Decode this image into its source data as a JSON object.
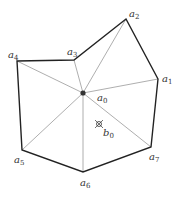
{
  "diagram": {
    "type": "star-shaped polygon triangulation",
    "center": {
      "id": "a0",
      "label": "a",
      "sub": "0",
      "x": 83,
      "y": 93,
      "lx": 97,
      "ly": 101
    },
    "interior_point": {
      "id": "b0",
      "label": "b",
      "sub": "0",
      "x": 99,
      "y": 124,
      "lx": 103,
      "ly": 136
    },
    "vertices": [
      {
        "id": "a1",
        "label": "a",
        "sub": "1",
        "x": 158,
        "y": 79,
        "lx": 162,
        "ly": 82
      },
      {
        "id": "a2",
        "label": "a",
        "sub": "2",
        "x": 126,
        "y": 19,
        "lx": 129,
        "ly": 17
      },
      {
        "id": "a3",
        "label": "a",
        "sub": "3",
        "x": 74,
        "y": 60,
        "lx": 67,
        "ly": 55
      },
      {
        "id": "a4",
        "label": "a",
        "sub": "4",
        "x": 17,
        "y": 61,
        "lx": 8,
        "ly": 58
      },
      {
        "id": "a5",
        "label": "a",
        "sub": "5",
        "x": 22,
        "y": 150,
        "lx": 14,
        "ly": 163
      },
      {
        "id": "a6",
        "label": "a",
        "sub": "6",
        "x": 83,
        "y": 172,
        "lx": 80,
        "ly": 186
      },
      {
        "id": "a7",
        "label": "a",
        "sub": "7",
        "x": 151,
        "y": 147,
        "lx": 149,
        "ly": 160
      }
    ],
    "colors": {
      "boundary": "#222222",
      "spoke": "#999999",
      "point": "#333333"
    }
  }
}
